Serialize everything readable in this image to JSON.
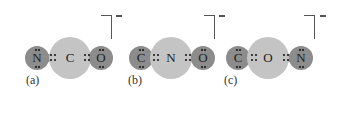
{
  "diagram": {
    "colors": {
      "terminal_atom": "#8c8c8c",
      "central_atom": "#c4c4c4",
      "background": "#ffffff"
    },
    "structures": [
      {
        "label": "(a)",
        "charge": "−",
        "left": "N",
        "center": "C",
        "right": "O"
      },
      {
        "label": "(b)",
        "charge": "−",
        "left": "C",
        "center": "N",
        "right": "O"
      },
      {
        "label": "(c)",
        "charge": "−",
        "left": "C",
        "center": "O",
        "right": "N"
      }
    ]
  }
}
